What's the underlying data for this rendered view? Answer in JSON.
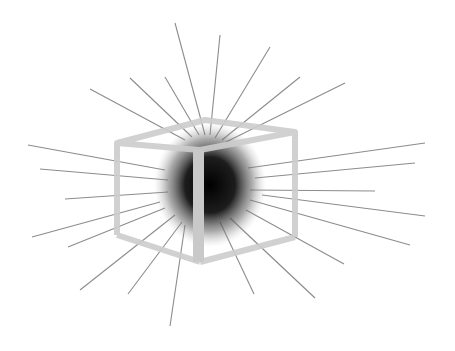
{
  "illustration": {
    "subject": "radiating-sphere-inside-wireframe-cube",
    "colors": {
      "background": "#ffffff",
      "rays": "#8a8a8a",
      "cube_edges": "#cfcfcf",
      "sphere_core": "#000000"
    }
  }
}
